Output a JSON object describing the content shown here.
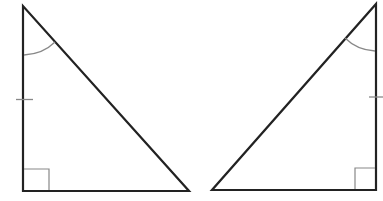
{
  "diagram": {
    "type": "congruent-right-triangles",
    "colors": {
      "background": "#ffffff",
      "edge": "#222222",
      "marker": "#888888"
    },
    "triangles": [
      {
        "id": "left",
        "vertices": [
          [
            23,
            6
          ],
          [
            23,
            191
          ],
          [
            189,
            191
          ]
        ],
        "right_angle_at": [
          23,
          191
        ],
        "angle_arc_at": [
          23,
          6
        ],
        "tick_on_side": "vertical-leg",
        "tick_position": [
          23,
          100
        ]
      },
      {
        "id": "right",
        "vertices": [
          [
            376,
            4
          ],
          [
            376,
            190
          ],
          [
            212,
            190
          ]
        ],
        "right_angle_at": [
          376,
          190
        ],
        "angle_arc_at": [
          376,
          4
        ],
        "tick_on_side": "vertical-leg",
        "tick_position": [
          376,
          97
        ]
      }
    ]
  }
}
